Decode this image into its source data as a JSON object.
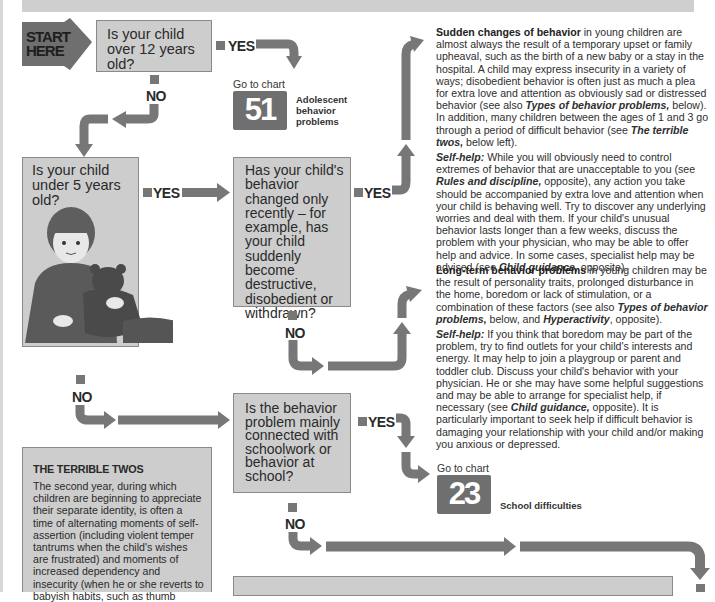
{
  "start": {
    "line1": "START",
    "line2": "HERE"
  },
  "questions": {
    "q1": "Is your child over 12 years old?",
    "q2": "Is your child under 5 years old?",
    "q3": "Has your child's behavior changed only recently – for example, has your child suddenly become destructive, disobedient or withdrawn?",
    "q4": "Is the behavior problem mainly connected with schoolwork or behavior at school?"
  },
  "labels": {
    "yes": "YES",
    "no": "NO"
  },
  "goto": {
    "prefix": "Go to chart",
    "chart51": {
      "number": "51",
      "title": "Adolescent behavior problems"
    },
    "chart23": {
      "number": "23",
      "title": "School difficulties"
    }
  },
  "sudden": {
    "heading": "Sudden changes of behavior",
    "body1": " in young children are almost always the result of a temporary upset or family upheaval, such as the birth of a new baby or a stay in the hospital. A child may express insecurity in a variety of ways; disobedient behavior is often just as much a plea for extra love and attention as obviously sad or distressed behavior (see also ",
    "ref1": "Types of behavior problems,",
    "body2": " below). In addition, many children between the ages of 1 and 3 go through a period of difficult behavior (see ",
    "ref2": "The terrible twos,",
    "body3": " below left).",
    "selfhelp_label": "Self-help:",
    "selfhelp1": " While you will obviously need to control extremes of behavior that are unacceptable to you (see ",
    "selfhelp_ref1": "Rules and discipline,",
    "selfhelp2": " opposite), any action you take should be accompanied by extra love and attention when your child is behaving well. Try to discover any underlying worries and deal with them. If your child's unusual behavior lasts longer than a few weeks, discuss the problem with your physician, who may be able to offer help and advice. In some cases, specialist help may be advised (see ",
    "selfhelp_ref2": "Child guidance,",
    "selfhelp3": " opposite)."
  },
  "longterm": {
    "heading": "Long-term behavior problems",
    "body1": " in young children may be the result of personality traits, prolonged disturbance in the home, boredom or lack of stimulation, or a combination of these factors (see also ",
    "ref1": "Types of behavior problems,",
    "body2": " below, and ",
    "ref2": "Hyperactivity",
    "body3": ", opposite).",
    "selfhelp_label": "Self-help:",
    "selfhelp1": " If you think that boredom may be part of the problem, try to find outlets for your child's interests and energy. It may help to join a playgroup or parent and toddler club. Discuss your child's behavior with your physician. He or she may have some helpful suggestions and may be able to arrange for specialist help, if necessary (see ",
    "selfhelp_ref": "Child guidance,",
    "selfhelp2": " opposite). It is particularly important to seek help if difficult behavior is damaging your relationship with your child and/or making you anxious or depressed."
  },
  "terrible_twos": {
    "title": "THE TERRIBLE TWOS",
    "body": "The second year, during which children are beginning to appreciate their separate identity, is often a time of alternating moments of self-assertion (including violent temper tantrums when the child's wishes are frustrated) and moments of increased dependency and insecurity (when he or she reverts to babyish habits, such as thumb"
  },
  "colors": {
    "box": "#cdcdcd",
    "arrow": "#777777",
    "chart_badge": "#6f6f6f",
    "band": "#cfcfcf"
  }
}
